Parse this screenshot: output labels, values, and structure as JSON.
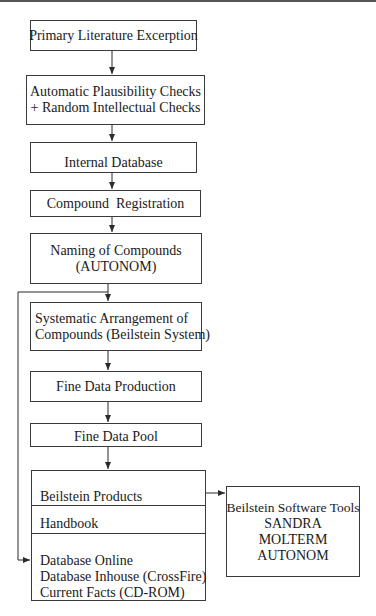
{
  "diagram": {
    "type": "flowchart",
    "boxes": [
      {
        "id": "primary-literature",
        "lines": [
          "Primary Literature Excerption"
        ]
      },
      {
        "id": "plausibility-checks",
        "lines": [
          "Automatic Plausibility Checks",
          "+ Random Intellectual Checks"
        ]
      },
      {
        "id": "internal-database",
        "lines": [
          "Internal Database"
        ]
      },
      {
        "id": "compound-registration",
        "lines": [
          "Compound  Registration"
        ]
      },
      {
        "id": "naming",
        "lines": [
          "Naming of Compounds",
          "(AUTONOM)"
        ]
      },
      {
        "id": "systematic-arrangement",
        "lines": [
          "Systematic Arrangement of",
          "Compounds (Beilstein System)"
        ]
      },
      {
        "id": "fine-data-production",
        "lines": [
          "Fine Data Production"
        ]
      },
      {
        "id": "fine-data-pool",
        "lines": [
          "Fine Data Pool"
        ]
      }
    ],
    "products": {
      "title": "Beilstein Products",
      "handbook": "Handbook",
      "items": [
        "Database Online",
        "Database Inhouse (CrossFire)",
        "Current Facts (CD-ROM)"
      ]
    },
    "software_tools": {
      "title": "Beilstein Software Tools",
      "items": [
        "SANDRA",
        "MOLTERM",
        "AUTONOM"
      ]
    },
    "edges": [
      {
        "from": "primary-literature",
        "to": "plausibility-checks"
      },
      {
        "from": "plausibility-checks",
        "to": "internal-database"
      },
      {
        "from": "internal-database",
        "to": "compound-registration"
      },
      {
        "from": "compound-registration",
        "to": "naming"
      },
      {
        "from": "naming",
        "to": "systematic-arrangement"
      },
      {
        "from": "systematic-arrangement",
        "to": "fine-data-production"
      },
      {
        "from": "fine-data-production",
        "to": "fine-data-pool"
      },
      {
        "from": "fine-data-pool",
        "to": "products"
      },
      {
        "from": "products",
        "to": "software-tools"
      },
      {
        "from": "naming",
        "to": "products-databases",
        "note": "bypass loop on left"
      }
    ]
  }
}
